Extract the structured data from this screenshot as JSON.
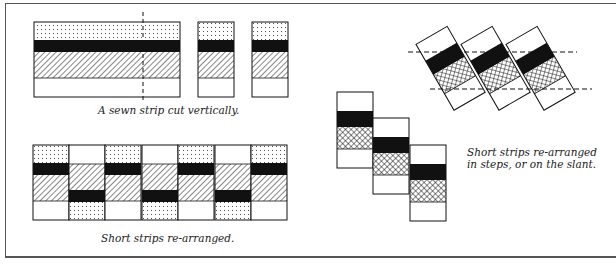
{
  "captions": {
    "cut": "A sewn strip cut vertically.",
    "rearranged": "Short strips re-arranged.",
    "steps_line1": "Short strips re-arranged",
    "steps_line2": "in steps, or on the slant."
  },
  "fabric_bands": [
    "dotted",
    "black",
    "diagonal-hatch",
    "white"
  ],
  "stepped_bands": [
    "white",
    "black",
    "cross-hatch",
    "white"
  ],
  "colors": {
    "ink": "#111111",
    "paper": "#ffffff",
    "frame": "#555555"
  }
}
